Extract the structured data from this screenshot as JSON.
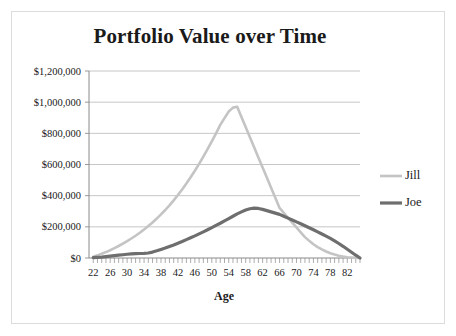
{
  "chart_data": {
    "type": "line",
    "title": "Portfolio Value over Time",
    "xlabel": "Age",
    "ylabel": "",
    "xlim": [
      21,
      85
    ],
    "ylim": [
      0,
      1200000
    ],
    "grid": true,
    "legend_position": "right",
    "y_ticks": [
      0,
      200000,
      400000,
      600000,
      800000,
      1000000,
      1200000
    ],
    "y_tick_labels": [
      "$0",
      "$200,000",
      "$400,000",
      "$600,000",
      "$800,000",
      "$1,000,000",
      "$1,200,000"
    ],
    "x_ticks": [
      22,
      26,
      30,
      34,
      38,
      42,
      46,
      50,
      54,
      58,
      62,
      66,
      70,
      74,
      78,
      82
    ],
    "x_tick_labels": [
      "22",
      "26",
      "30",
      "34",
      "38",
      "42",
      "46",
      "50",
      "54",
      "58",
      "62",
      "66",
      "70",
      "74",
      "78",
      "82"
    ],
    "x_minor_tick_step": 1,
    "x": [
      22,
      23,
      24,
      25,
      26,
      27,
      28,
      29,
      30,
      31,
      32,
      33,
      34,
      35,
      36,
      37,
      38,
      39,
      40,
      41,
      42,
      43,
      44,
      45,
      46,
      47,
      48,
      49,
      50,
      51,
      52,
      53,
      54,
      55,
      56,
      57,
      58,
      59,
      60,
      61,
      62,
      63,
      64,
      65,
      66,
      67,
      68,
      69,
      70,
      71,
      72,
      73,
      74,
      75,
      76,
      77,
      78,
      79,
      80,
      81,
      82,
      83,
      84,
      85
    ],
    "series": [
      {
        "name": "Jill",
        "color": "#c4c4c4",
        "width": 2.6,
        "values": [
          8000,
          17000,
          27000,
          38000,
          50000,
          63000,
          77000,
          92000,
          108000,
          125000,
          143000,
          162000,
          183000,
          205000,
          228000,
          253000,
          280000,
          308000,
          338000,
          370000,
          404000,
          440000,
          478000,
          518000,
          560000,
          604000,
          650000,
          698000,
          748000,
          800000,
          854000,
          898000,
          940000,
          965000,
          970000,
          905000,
          840000,
          775000,
          710000,
          645000,
          580000,
          516000,
          451000,
          386000,
          321000,
          290000,
          258000,
          227000,
          196000,
          165000,
          134000,
          110000,
          88000,
          70000,
          55000,
          42000,
          31000,
          22000,
          15000,
          9000,
          5000,
          3000,
          1000,
          0
        ]
      },
      {
        "name": "Joe",
        "color": "#6e6e6e",
        "width": 3.2,
        "values": [
          2000,
          4000,
          6000,
          9000,
          12000,
          15000,
          18000,
          21000,
          24000,
          26000,
          28000,
          29000,
          30000,
          32000,
          38000,
          46000,
          55000,
          64000,
          74000,
          84000,
          95000,
          106000,
          118000,
          130000,
          142000,
          155000,
          168000,
          181000,
          195000,
          209000,
          223000,
          238000,
          253000,
          268000,
          283000,
          296000,
          308000,
          316000,
          320000,
          318000,
          312000,
          304000,
          296000,
          288000,
          280000,
          268000,
          256000,
          244000,
          232000,
          220000,
          207000,
          194000,
          181000,
          168000,
          154000,
          140000,
          126000,
          110000,
          93000,
          75000,
          56000,
          37000,
          18000,
          0
        ]
      }
    ],
    "legend": [
      {
        "label": "Jill",
        "color": "#c4c4c4"
      },
      {
        "label": "Joe",
        "color": "#6e6e6e"
      }
    ]
  },
  "colors": {
    "jill": "#c4c4c4",
    "joe": "#6e6e6e",
    "grid": "#b8b8b8",
    "axis": "#8a8a8a",
    "text": "#1a1a1a",
    "border": "#dcdcdc",
    "background": "#ffffff"
  }
}
